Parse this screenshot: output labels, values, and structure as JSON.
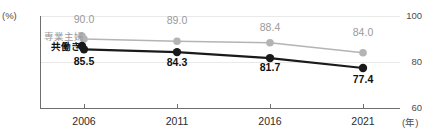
{
  "chart_data": {
    "type": "line",
    "title": "",
    "xlabel": "(年)",
    "ylabel": "(%)",
    "categories": [
      "2006",
      "2011",
      "2016",
      "2021"
    ],
    "ylim": [
      60,
      100
    ],
    "yticks": [
      "100",
      "80",
      "60"
    ],
    "grid": true,
    "legend_position": "inline-left",
    "series": [
      {
        "name": "専業主婦",
        "color": "#b4b4b4",
        "marker": "circle",
        "values": [
          90.0,
          89.0,
          88.4,
          84.0
        ],
        "labels": [
          "90.0",
          "89.0",
          "88.4",
          "84.0"
        ]
      },
      {
        "name": "共働き",
        "color": "#1a1a1a",
        "marker": "circle",
        "values": [
          85.5,
          84.3,
          81.7,
          77.4
        ],
        "labels": [
          "85.5",
          "84.3",
          "81.7",
          "77.4"
        ]
      }
    ]
  },
  "axes": {
    "y_unit": "(%)",
    "x_unit": "(年)"
  }
}
